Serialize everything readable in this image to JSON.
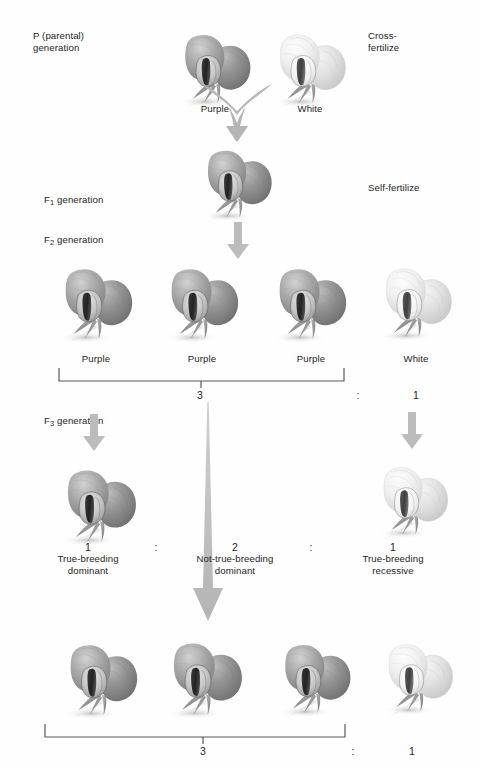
{
  "figure": {
    "background_color": "#fefefe",
    "text_color": "#231f20",
    "arrow_color": "#b3b3b3",
    "bracket_color": "#4d4d4d",
    "purple_flower_color": "#9a9a9a",
    "white_flower_color": "#eeeeee"
  },
  "generations": {
    "p_label": "P (parental)\ngeneration",
    "f1_label_prefix": "F",
    "f1_label_sub": "1",
    "f1_label_suffix": " generation",
    "f2_label_prefix": "F",
    "f2_label_sub": "2",
    "f2_label_suffix": " generation",
    "f3_label_prefix": "F",
    "f3_label_sub": "3",
    "f3_label_suffix": " generation"
  },
  "operations": {
    "cross_fertilize": "Cross-\nfertilize",
    "self_fertilize": "Self-fertilize"
  },
  "p_row": {
    "flowers": [
      {
        "name": "p-purple-flower",
        "color": "purple",
        "label": "Purple",
        "x": 213,
        "y": 68,
        "scale": 1.0
      },
      {
        "name": "p-white-flower",
        "color": "white",
        "label": "White",
        "x": 308,
        "y": 68,
        "scale": 1.0
      }
    ]
  },
  "f1_row": {
    "flowers": [
      {
        "name": "f1-purple-flower",
        "color": "purple",
        "x": 237,
        "y": 183,
        "scale": 1.0
      }
    ]
  },
  "f2_row": {
    "flowers": [
      {
        "name": "f2-flower-1",
        "color": "purple",
        "label": "Purple",
        "x": 96,
        "y": 300,
        "scale": 1.02
      },
      {
        "name": "f2-flower-2",
        "color": "purple",
        "label": "Purple",
        "x": 202,
        "y": 300,
        "scale": 1.02
      },
      {
        "name": "f2-flower-3",
        "color": "purple",
        "label": "Purple",
        "x": 311,
        "y": 300,
        "scale": 1.02
      },
      {
        "name": "f2-flower-4",
        "color": "white",
        "label": "White",
        "x": 416,
        "y": 300,
        "scale": 1.0
      }
    ],
    "ratio": {
      "left": "3",
      "colon": ":",
      "right": "1"
    }
  },
  "f3_row": {
    "flowers": [
      {
        "name": "f3-flower-left",
        "color": "purple",
        "x": 99,
        "y": 502,
        "scale": 1.04
      },
      {
        "name": "f3-flower-right",
        "color": "white",
        "x": 414,
        "y": 500,
        "scale": 0.98
      }
    ],
    "ratio": {
      "left_number": "1",
      "left_caption": "True-breeding\ndominant",
      "colon_1": ":",
      "middle_number": "2",
      "middle_caption": "Not-true-breeding\ndominant",
      "colon_2": ":",
      "right_number": "1",
      "right_caption": "True-breeding\nrecessive"
    }
  },
  "f3_bottom_row": {
    "flowers": [
      {
        "name": "f3-bottom-flower-1",
        "color": "purple",
        "x": 101,
        "y": 676,
        "scale": 1.02
      },
      {
        "name": "f3-bottom-flower-2",
        "color": "purple",
        "x": 206,
        "y": 676,
        "scale": 1.04
      },
      {
        "name": "f3-bottom-flower-3",
        "color": "purple",
        "x": 316,
        "y": 676,
        "scale": 1.0
      },
      {
        "name": "f3-bottom-flower-4",
        "color": "white",
        "x": 419,
        "y": 676,
        "scale": 0.98
      }
    ],
    "ratio": {
      "left": "3",
      "colon": ":",
      "right": "1"
    }
  }
}
